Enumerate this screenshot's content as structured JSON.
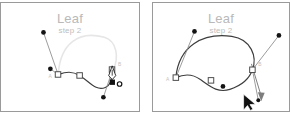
{
  "document": {
    "kind": "vector-illustration-tutorial",
    "panel_count": 2
  },
  "panels": [
    {
      "id": "left",
      "title": "Leaf",
      "subtitle": "step 2",
      "anchor_labels": {
        "start": "A",
        "end": "B"
      },
      "cursor": "pen-tool-close-path",
      "cursor_badge": "circle",
      "note": "open path drawn from A to B, pen hovering over A/B to close path; faint preview of closing curve"
    },
    {
      "id": "right",
      "title": "Leaf",
      "subtitle": "step 2",
      "anchor_labels": {
        "start": "A",
        "end": "B"
      },
      "cursor": "arrow-pointer",
      "drag_indicator": "down-arrow",
      "note": "closed leaf shape with direction handles visible; arrow cursor dragging handle downward"
    }
  ],
  "colors": {
    "panel_border": "#9a9a9a",
    "title_text": "#b9b9b9",
    "subtitle_text": "#bdbdbd",
    "path_stroke": "#3a3a3a",
    "preview_stroke": "#e2e2e2",
    "handle_line": "#8f8f8f",
    "anchor_fill": "#ffffff",
    "anchor_stroke": "#4a4a4a",
    "control_point_fill": "#1a1a1a",
    "label_text": "#c0c0c0",
    "cursor_fill": "#111111",
    "background": "#ffffff"
  },
  "geometry": {
    "left_panel": {
      "anchor_a": [
        58,
        73
      ],
      "anchor_mid": [
        80,
        74
      ],
      "anchor_b": [
        113,
        69
      ],
      "handle_a_up": [
        43,
        30
      ],
      "handle_a_curve": [
        49,
        67
      ],
      "handle_b_down": [
        105,
        96
      ],
      "preview_apex": [
        85,
        43
      ]
    },
    "right_panel": {
      "anchor_a": [
        175,
        76
      ],
      "anchor_mid": [
        211,
        78
      ],
      "anchor_b": [
        253,
        69
      ],
      "handle_a_up": [
        194,
        29
      ],
      "handle_mid_dot": [
        223,
        85
      ],
      "handle_b_up": [
        280,
        33
      ],
      "drag_target": [
        259,
        99
      ]
    }
  }
}
